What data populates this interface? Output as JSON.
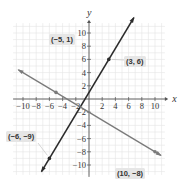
{
  "chart_data": {
    "type": "line",
    "title": "",
    "xlabel": "x",
    "ylabel": "y",
    "xlim": [
      -11,
      11
    ],
    "ylim": [
      -11,
      11
    ],
    "grid": true,
    "x_ticks": [
      -10,
      -8,
      -6,
      -4,
      -2,
      2,
      4,
      6,
      8,
      10
    ],
    "y_ticks": [
      10,
      8,
      6,
      4,
      2,
      -2,
      -4,
      -6,
      -8,
      -10
    ],
    "x_tick_labels": [
      "−10",
      "−8",
      "−6",
      "−4",
      "−2",
      "2",
      "4",
      "6",
      "8",
      "10"
    ],
    "y_tick_labels": [
      "10",
      "8",
      "6",
      "4",
      "2",
      "−2",
      "−4",
      "−6",
      "−8",
      "−10"
    ],
    "series": [
      {
        "name": "steep line through (-6,-9) and (3,6)",
        "color": "#2b2b2b",
        "points": [
          {
            "x": -6,
            "y": -9,
            "label": "(−6, −9)"
          },
          {
            "x": 3,
            "y": 6,
            "label": "(3, 6)"
          }
        ],
        "slope": 1.6667,
        "intercept": 1
      },
      {
        "name": "falling line through (-5,1) and (10,-8)",
        "color": "#7a7a7a",
        "points": [
          {
            "x": -5,
            "y": 1,
            "label": "(−5, 1)"
          },
          {
            "x": 10,
            "y": -8,
            "label": "(10, −8)"
          }
        ],
        "slope": -0.6,
        "intercept": -2
      }
    ],
    "annotations": [
      "(3, 6)",
      "(−5, 1)",
      "(−6, −9)",
      "(10, −8)"
    ]
  },
  "colors": {
    "grid": "#e4e4e4",
    "axis": "#555555",
    "line_dark": "#2b2b2b",
    "line_gray": "#7a7a7a",
    "label_bg": "#e6e6e6"
  }
}
